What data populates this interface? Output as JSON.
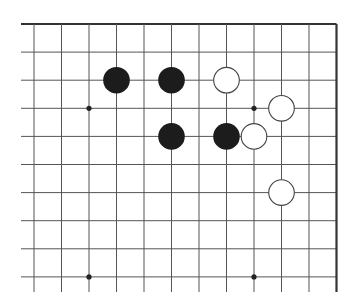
{
  "diagram": {
    "type": "go-board-fragment",
    "visible_edges": [
      "top",
      "right"
    ],
    "columns": 12,
    "rows": 10,
    "colors": {
      "background": "#ffffff",
      "grid_line": "#555555",
      "edge_line": "#333333",
      "black_stone": "#1c1c1c",
      "white_stone_fill": "#ffffff",
      "white_stone_stroke": "#444444",
      "star_point": "#222222"
    },
    "star_points": [
      {
        "col": 2,
        "row": 3
      },
      {
        "col": 8,
        "row": 3
      },
      {
        "col": 2,
        "row": 9
      },
      {
        "col": 8,
        "row": 9
      }
    ],
    "stones": [
      {
        "color": "black",
        "col": 3,
        "row": 2
      },
      {
        "color": "black",
        "col": 5,
        "row": 2
      },
      {
        "color": "black",
        "col": 5,
        "row": 4
      },
      {
        "color": "black",
        "col": 7,
        "row": 4
      },
      {
        "color": "white",
        "col": 7,
        "row": 2
      },
      {
        "color": "white",
        "col": 9,
        "row": 3
      },
      {
        "color": "white",
        "col": 8,
        "row": 4
      },
      {
        "color": "white",
        "col": 9,
        "row": 6
      }
    ]
  }
}
